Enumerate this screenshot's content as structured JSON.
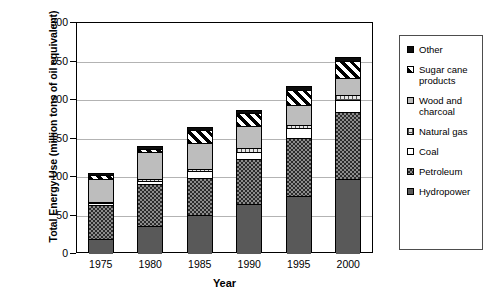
{
  "chart_data": {
    "type": "bar",
    "stacked": true,
    "title": "",
    "xlabel": "Year",
    "ylabel": "Total Energy Use (million tons of oil equivalent)",
    "categories": [
      "1975",
      "1980",
      "1985",
      "1990",
      "1995",
      "2000"
    ],
    "ylim": [
      0,
      300
    ],
    "yticks": [
      0,
      50,
      100,
      150,
      200,
      250,
      300
    ],
    "ytick_labels": [
      "0",
      "50",
      "100",
      "150",
      "200",
      "250",
      "300"
    ],
    "grid": true,
    "legend_position": "right",
    "series": [
      {
        "name": "Hydropower",
        "key": "hydropower",
        "pattern": "solid-dark-gray",
        "values": [
          20,
          36,
          51,
          65,
          75,
          97
        ]
      },
      {
        "name": "Petroleum",
        "key": "petroleum",
        "pattern": "dense-checker",
        "values": [
          43,
          55,
          48,
          58,
          75,
          88
        ]
      },
      {
        "name": "Coal",
        "key": "coal",
        "pattern": "solid-white",
        "values": [
          3,
          4,
          9,
          10,
          13,
          15
        ]
      },
      {
        "name": "Natural gas",
        "key": "naturalgas",
        "pattern": "fine-grid",
        "values": [
          2,
          2,
          3,
          4,
          5,
          7
        ]
      },
      {
        "name": "Wood and charcoal",
        "key": "wood",
        "pattern": "solid-light-gray",
        "values": [
          30,
          35,
          33,
          29,
          25,
          22
        ]
      },
      {
        "name": "Sugar cane products",
        "key": "sugarcane",
        "pattern": "diagonal-hatch",
        "values": [
          4,
          5,
          17,
          17,
          20,
          22
        ]
      },
      {
        "name": "Other",
        "key": "other",
        "pattern": "solid-black",
        "values": [
          2,
          2,
          3,
          3,
          4,
          4
        ]
      }
    ],
    "totals": [
      104,
      139,
      164,
      186,
      217,
      255
    ]
  },
  "axes": {
    "y_title": "Total Energy Use (million tons of oil equivalent)",
    "x_title": "Year",
    "y_ticks": [
      "300",
      "250",
      "200",
      "150",
      "100",
      "50",
      "0"
    ],
    "x_ticks": [
      "1975",
      "1980",
      "1985",
      "1990",
      "1995",
      "2000"
    ]
  },
  "legend": {
    "items": [
      {
        "label": "Other",
        "swatch": "other-swatch"
      },
      {
        "label": "Sugar cane\nproducts",
        "swatch": "sugarcane-swatch"
      },
      {
        "label": "Wood and\ncharcoal",
        "swatch": "wood-swatch"
      },
      {
        "label": "Natural gas",
        "swatch": "naturalgas-swatch"
      },
      {
        "label": "Coal",
        "swatch": "coal-swatch"
      },
      {
        "label": "Petroleum",
        "swatch": "petroleum-swatch"
      },
      {
        "label": "Hydropower",
        "swatch": "hydropower-swatch"
      }
    ]
  }
}
